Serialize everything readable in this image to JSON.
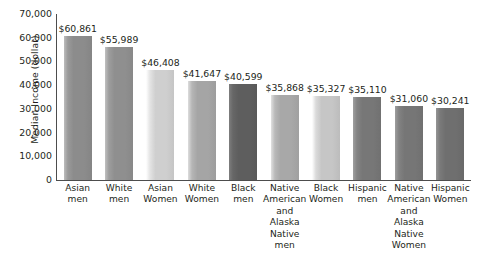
{
  "chart_data": {
    "type": "bar",
    "title": "",
    "xlabel": "",
    "ylabel": "Median Income (dollar)",
    "ylim": [
      0,
      70000
    ],
    "grid": false,
    "legend": "none",
    "ytick_labels": [
      "70,000",
      "60,000",
      "50,000",
      "40,000",
      "30,000",
      "20,000",
      "10,000",
      "0"
    ],
    "ytick_values": [
      70000,
      60000,
      50000,
      40000,
      30000,
      20000,
      10000,
      0
    ],
    "categories": [
      "Asian men",
      "White men",
      "Asian Women",
      "White Women",
      "Black men",
      "Native American and Alaska Native men",
      "Black Women",
      "Hispanic men",
      "Native American and Alaska Native Women",
      "Hispanic Women"
    ],
    "category_lines": [
      [
        "Asian",
        "men"
      ],
      [
        "White",
        "men"
      ],
      [
        "Asian",
        "Women"
      ],
      [
        "White",
        "Women"
      ],
      [
        "Black",
        "men"
      ],
      [
        "Native",
        "American",
        "and",
        "Alaska",
        "Native",
        "men"
      ],
      [
        "Black",
        "Women"
      ],
      [
        "Hispanic",
        "men"
      ],
      [
        "Native",
        "American",
        "and",
        "Alaska",
        "Native",
        "Women"
      ],
      [
        "Hispanic",
        "Women"
      ]
    ],
    "values": [
      60861,
      55989,
      46408,
      41647,
      40599,
      35868,
      35327,
      35110,
      31060,
      30241
    ],
    "value_labels": [
      "$60,861",
      "$55,989",
      "$46,408",
      "$41,647",
      "$40,599",
      "$35,868",
      "$35,327",
      "$35,110",
      "$31,060",
      "$30,241"
    ],
    "bar_colors": [
      "#8c8c8c",
      "#8f8f8f",
      "#cfcfcf",
      "#a5a5a5",
      "#5e5e5e",
      "#a8a8a8",
      "#c6c6c6",
      "#777777",
      "#767676",
      "#6f6f6f"
    ]
  }
}
